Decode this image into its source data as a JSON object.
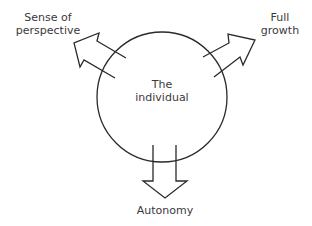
{
  "diagram": {
    "center_label": [
      "The",
      "individual"
    ],
    "outputs": [
      {
        "id": "perspective",
        "label": [
          "Sense of",
          "perspective"
        ],
        "direction": "upper-left"
      },
      {
        "id": "growth",
        "label": [
          "Full",
          "growth"
        ],
        "direction": "upper-right"
      },
      {
        "id": "autonomy",
        "label": [
          "Autonomy"
        ],
        "direction": "down"
      }
    ],
    "colors": {
      "stroke": "#2a2a2a",
      "text": "#3a3a3a",
      "background": "#ffffff"
    }
  }
}
